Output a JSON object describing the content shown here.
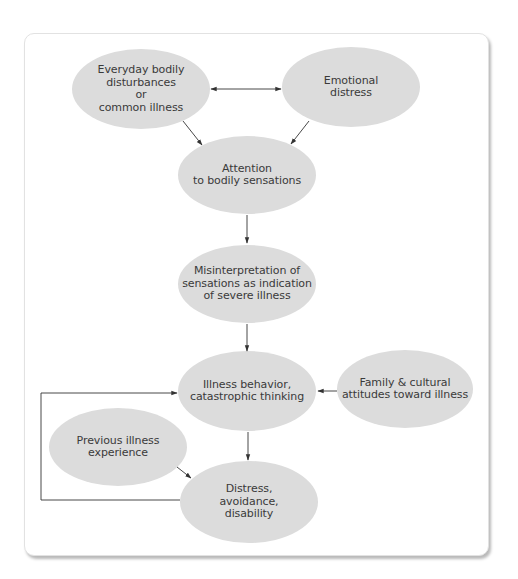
{
  "diagram": {
    "colors": {
      "node_fill": "#dcdcdc",
      "arrow": "#333333",
      "card_border": "#e2e2e2",
      "text": "#3a3a3a"
    },
    "nodes": {
      "everyday": {
        "label": "Everyday bodily\ndisturbances\nor\ncommon illness"
      },
      "emotional": {
        "label": "Emotional\ndistress"
      },
      "attention": {
        "label": "Attention\nto bodily sensations"
      },
      "misinterpretation": {
        "label": "Misinterpretation of\nsensations as indication\nof severe illness"
      },
      "illness_behavior": {
        "label": "Illness behavior,\ncatastrophic thinking"
      },
      "family": {
        "label": "Family & cultural\nattitudes toward illness"
      },
      "previous": {
        "label": "Previous illness\nexperience"
      },
      "distress": {
        "label": "Distress,\navoidance,\ndisability"
      }
    },
    "edges": [
      {
        "from": "everyday",
        "to": "emotional",
        "type": "bidirectional"
      },
      {
        "from": "everyday",
        "to": "attention",
        "type": "directed"
      },
      {
        "from": "emotional",
        "to": "attention",
        "type": "directed"
      },
      {
        "from": "attention",
        "to": "misinterpretation",
        "type": "directed"
      },
      {
        "from": "misinterpretation",
        "to": "illness_behavior",
        "type": "directed"
      },
      {
        "from": "family",
        "to": "illness_behavior",
        "type": "directed"
      },
      {
        "from": "illness_behavior",
        "to": "distress",
        "type": "directed"
      },
      {
        "from": "previous",
        "to": "distress",
        "type": "directed"
      },
      {
        "from": "distress",
        "to": "illness_behavior",
        "type": "feedback-loop"
      }
    ]
  }
}
